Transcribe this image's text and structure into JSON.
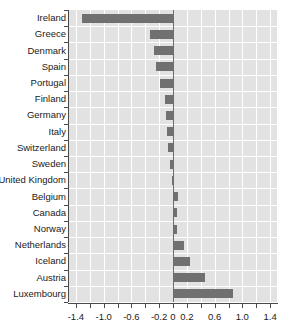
{
  "chart_data": {
    "type": "bar",
    "orientation": "horizontal",
    "title": "",
    "xlabel": "",
    "ylabel": "",
    "xlim": [
      -1.5,
      1.5
    ],
    "xticks": [
      -1.4,
      -1.0,
      -0.6,
      -0.2,
      0,
      0.2,
      0.6,
      1.0,
      1.4
    ],
    "xticklabels": [
      "-1.4",
      "-1.0",
      "-0.6",
      "-0.2",
      "0",
      "0.2",
      "0.6",
      "1.0",
      "1.4"
    ],
    "grid": true,
    "legend": null,
    "bar_color": "#707070",
    "panel_color": "#e2e2e2",
    "gridline_color": "#ffffff",
    "categories": [
      "Ireland",
      "Greece",
      "Denmark",
      "Spain",
      "Portugal",
      "Finland",
      "Germany",
      "Italy",
      "Switzerland",
      "Sweden",
      "United Kingdom",
      "Belgium",
      "Canada",
      "Norway",
      "Netherlands",
      "Iceland",
      "Austria",
      "Luxembourg"
    ],
    "values": [
      -1.31,
      -0.33,
      -0.27,
      -0.25,
      -0.19,
      -0.12,
      -0.1,
      -0.09,
      -0.07,
      -0.05,
      -0.01,
      0.07,
      0.06,
      0.06,
      0.16,
      0.24,
      0.46,
      0.87
    ]
  },
  "axes": {
    "y_labels": [
      "Ireland",
      "Greece",
      "Denmark",
      "Spain",
      "Portugal",
      "Finland",
      "Germany",
      "Italy",
      "Switzerland",
      "Sweden",
      "United Kingdom",
      "Belgium",
      "Canada",
      "Norway",
      "Netherlands",
      "Iceland",
      "Austria",
      "Luxembourg"
    ],
    "x_labels": [
      "-1.4",
      "-1.0",
      "-0.6",
      "-0.2",
      "0",
      "0.2",
      "0.6",
      "1.0",
      "1.4"
    ]
  }
}
